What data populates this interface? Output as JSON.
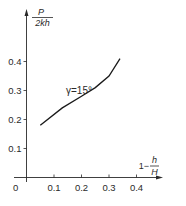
{
  "chart_data": {
    "type": "line",
    "title": "",
    "xlabel": "1 − h/H",
    "ylabel": "P/(2kh)",
    "xlabel_parts": {
      "prefix": "1−",
      "num": "h",
      "den": "H"
    },
    "ylabel_parts": {
      "num": "P",
      "den": "2kh"
    },
    "xlim": [
      0,
      0.5
    ],
    "ylim": [
      0,
      0.5
    ],
    "x_ticks": [
      "0.1",
      "0.2",
      "0.3",
      "0.4"
    ],
    "y_ticks": [
      "0.1",
      "0.2",
      "0.3",
      "0.4"
    ],
    "origin_label": "0",
    "grid": false,
    "legend": null,
    "annotations": [
      {
        "text": "γ=15°",
        "x": 0.12,
        "y": 0.3
      }
    ],
    "series": [
      {
        "name": "γ=15°",
        "x": [
          0.05,
          0.13,
          0.2,
          0.25,
          0.3,
          0.34
        ],
        "y": [
          0.18,
          0.24,
          0.28,
          0.31,
          0.35,
          0.41
        ]
      }
    ]
  }
}
